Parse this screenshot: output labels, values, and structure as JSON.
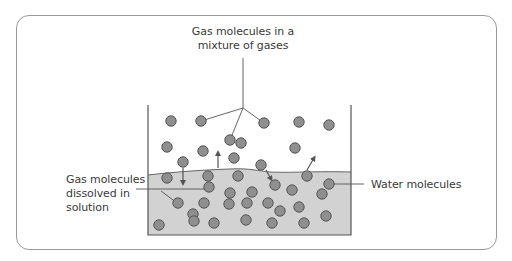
{
  "diagram": {
    "type": "gas-solubility-illustration",
    "labels": {
      "gas_mixture": {
        "line1": "Gas molecules in a",
        "line2": "mixture of gases"
      },
      "dissolved": {
        "line1": "Gas molecules",
        "line2": "dissolved in",
        "line3": "solution"
      },
      "water": {
        "line1": "Water molecules"
      }
    },
    "colors": {
      "molecule_fill": "#8f8f8f",
      "molecule_stroke": "#555555",
      "water_fill": "#d2d2d2",
      "line": "#555555",
      "frame": "#9a9a9a",
      "text": "#3a3a3a"
    },
    "beaker": {
      "left": 148,
      "right": 351,
      "top": 105,
      "bottom": 235
    },
    "gas_molecules": [
      [
        171,
        121
      ],
      [
        201,
        121
      ],
      [
        264,
        123
      ],
      [
        299,
        122
      ],
      [
        329,
        125
      ],
      [
        230,
        140
      ],
      [
        167,
        147
      ],
      [
        203,
        151
      ],
      [
        241,
        143
      ],
      [
        295,
        148
      ],
      [
        183,
        162
      ],
      [
        234,
        158
      ],
      [
        261,
        165
      ]
    ],
    "water_molecules": [
      [
        167,
        178
      ],
      [
        208,
        176
      ],
      [
        238,
        176
      ],
      [
        307,
        176
      ],
      [
        209,
        187
      ],
      [
        230,
        193
      ],
      [
        252,
        192
      ],
      [
        275,
        185
      ],
      [
        292,
        190
      ],
      [
        329,
        184
      ],
      [
        178,
        203
      ],
      [
        204,
        203
      ],
      [
        229,
        204
      ],
      [
        247,
        203
      ],
      [
        268,
        203
      ],
      [
        299,
        207
      ],
      [
        322,
        194
      ],
      [
        193,
        214
      ],
      [
        246,
        220
      ],
      [
        280,
        211
      ],
      [
        326,
        216
      ],
      [
        159,
        225
      ],
      [
        194,
        221
      ],
      [
        214,
        223
      ],
      [
        272,
        223
      ],
      [
        304,
        223
      ]
    ],
    "arrows": [
      {
        "from": [
          183,
          168
        ],
        "to": [
          183,
          183
        ],
        "direction": "down"
      },
      {
        "from": [
          218,
          168
        ],
        "to": [
          218,
          153
        ],
        "direction": "up"
      },
      {
        "from": [
          266,
          170
        ],
        "to": [
          271,
          179
        ],
        "direction": "down"
      },
      {
        "from": [
          307,
          170
        ],
        "to": [
          314,
          158
        ],
        "direction": "up"
      }
    ]
  }
}
